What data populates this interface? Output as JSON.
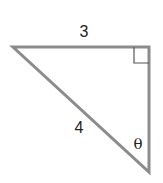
{
  "diagram": {
    "type": "right-triangle",
    "stroke_color": "#8c8c8c",
    "labels": {
      "top_side": "3",
      "hypotenuse": "4",
      "angle": "θ"
    },
    "right_angle_marker": true
  }
}
